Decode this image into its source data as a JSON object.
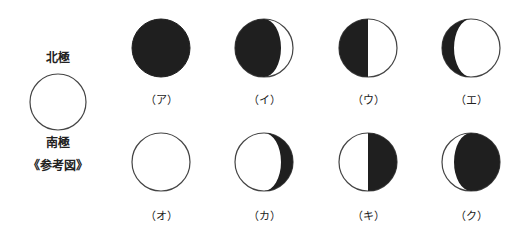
{
  "reference": {
    "north_label": "北極",
    "south_label": "南極",
    "caption": "《参考図》",
    "center": [
      58,
      102
    ],
    "radius": 28
  },
  "colors": {
    "dark": "#1f1f1f",
    "light": "#ffffff",
    "stroke": "#444444"
  },
  "phases": [
    {
      "label": "（ア）",
      "center": [
        161,
        48
      ],
      "shade": "full-dark"
    },
    {
      "label": "（イ）",
      "center": [
        264,
        48
      ],
      "shade": "dark-with-right-crescent-lit"
    },
    {
      "label": "（ウ）",
      "center": [
        368,
        48
      ],
      "shade": "left-half-dark"
    },
    {
      "label": "（エ）",
      "center": [
        471,
        48
      ],
      "shade": "left-crescent-dark"
    },
    {
      "label": "（オ）",
      "center": [
        161,
        162
      ],
      "shade": "full-light"
    },
    {
      "label": "（カ）",
      "center": [
        264,
        162
      ],
      "shade": "right-crescent-dark"
    },
    {
      "label": "（キ）",
      "center": [
        368,
        162
      ],
      "shade": "right-half-dark"
    },
    {
      "label": "（ク）",
      "center": [
        471,
        162
      ],
      "shade": "dark-with-left-crescent-lit"
    }
  ],
  "radius": 29
}
